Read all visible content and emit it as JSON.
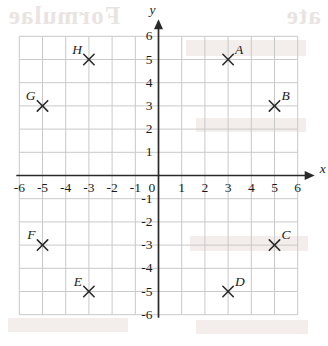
{
  "chart_data": {
    "type": "scatter",
    "title": "",
    "xlabel": "x",
    "ylabel": "y",
    "xlim": [
      -6,
      6
    ],
    "ylim": [
      -6,
      6
    ],
    "grid": true,
    "grid_step": 1,
    "legend": "none",
    "xticks": [
      "-6",
      "-5",
      "-4",
      "-3",
      "-2",
      "-1",
      "0",
      "1",
      "2",
      "3",
      "4",
      "5",
      "6"
    ],
    "yticks": [
      "6",
      "5",
      "4",
      "3",
      "2",
      "1",
      "0",
      "-1",
      "-2",
      "-3",
      "-4",
      "-5",
      "-6"
    ],
    "marker": "x-cross",
    "points": [
      {
        "label": "A",
        "x": 3,
        "y": 5,
        "label_pos": "upper-right"
      },
      {
        "label": "B",
        "x": 5,
        "y": 3,
        "label_pos": "upper-right"
      },
      {
        "label": "C",
        "x": 5,
        "y": -3,
        "label_pos": "upper-right"
      },
      {
        "label": "D",
        "x": 3,
        "y": -5,
        "label_pos": "upper-right"
      },
      {
        "label": "E",
        "x": -3,
        "y": -5,
        "label_pos": "upper-left"
      },
      {
        "label": "F",
        "x": -5,
        "y": -3,
        "label_pos": "upper-left"
      },
      {
        "label": "G",
        "x": -5,
        "y": 3,
        "label_pos": "upper-left"
      },
      {
        "label": "H",
        "x": -3,
        "y": 5,
        "label_pos": "upper-left"
      }
    ]
  },
  "colors": {
    "grid": "#c9c9c9",
    "axis": "#2a2a2a",
    "marker": "#2a2a2a",
    "text": "#1b1b1b",
    "background": "#ffffff",
    "ghost": "#e9e4e2"
  },
  "artifacts": {
    "ghost_text_top": "Formulae",
    "ghost_text_top_right": "ate",
    "note": "faint reversed bleed-through from reverse side of scanned page"
  }
}
